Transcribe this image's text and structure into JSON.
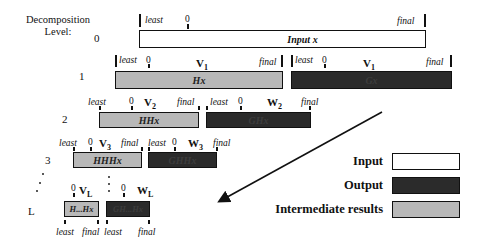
{
  "title": {
    "line1": "Decomposition",
    "line2": "Level:"
  },
  "labels": {
    "least": "least",
    "zero": "0",
    "final": "final"
  },
  "levels": [
    {
      "level": "0",
      "bars": [
        {
          "text": "Input x",
          "type": "input",
          "marker": ""
        }
      ]
    },
    {
      "level": "1",
      "bars": [
        {
          "text": "Hx",
          "type": "intermediate",
          "marker": "V",
          "sub": "1"
        },
        {
          "text": "Gx",
          "type": "output",
          "marker": "V",
          "sub": "1"
        }
      ]
    },
    {
      "level": "2",
      "bars": [
        {
          "text": "HHx",
          "type": "intermediate",
          "marker": "V",
          "sub": "2"
        },
        {
          "text": "GHx",
          "type": "output",
          "marker": "W",
          "sub": "2"
        }
      ]
    },
    {
      "level": "3",
      "bars": [
        {
          "text": "HHHx",
          "type": "intermediate",
          "marker": "V",
          "sub": "3"
        },
        {
          "text": "GHHx",
          "type": "output",
          "marker": "W",
          "sub": "3"
        }
      ]
    },
    {
      "level": "L",
      "bars": [
        {
          "text": "H...Hx",
          "type": "intermediate",
          "marker": "V",
          "sub": "L"
        },
        {
          "text": "GH...Hx",
          "type": "output",
          "marker": "W",
          "sub": "L"
        }
      ]
    }
  ],
  "legend": [
    {
      "label": "Input",
      "color": "#ffffff"
    },
    {
      "label": "Output",
      "color": "#2b2b2b"
    },
    {
      "label": "Intermediate results",
      "color": "#b8b8b8"
    }
  ],
  "colors": {
    "input": "#ffffff",
    "output": "#2b2b2b",
    "intermediate": "#b8b8b8",
    "stroke": "#111111"
  }
}
